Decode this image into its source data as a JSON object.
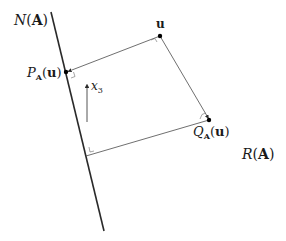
{
  "diagram": {
    "type": "orthogonal-projection",
    "colors": {
      "line": "#2a2a2a",
      "thin": "#4a4a4a",
      "point": "#000000",
      "text": "#1a1a1a"
    },
    "labels": {
      "nullspace": {
        "prefix": "N",
        "arg": "A",
        "text": "𝒩(A)"
      },
      "range": {
        "prefix": "R",
        "arg": "A",
        "text": "ℛ(A)"
      },
      "u": {
        "text": "u"
      },
      "p": {
        "base": "P",
        "sub": "A",
        "arg": "u",
        "text": "P_A(u)"
      },
      "q": {
        "base": "Q",
        "sub": "A",
        "arg": "u",
        "text": "Q_A(u)"
      },
      "x3": {
        "base": "x",
        "sub": "3",
        "text": "x_3"
      }
    },
    "points": {
      "u": [
        160,
        36
      ],
      "p": [
        66,
        72
      ],
      "q": [
        209,
        120
      ],
      "corner": [
        86,
        156
      ]
    },
    "nullspace_line": {
      "from": [
        51,
        12
      ],
      "to": [
        104,
        231
      ]
    },
    "x3_arrow": {
      "from": [
        87,
        122
      ],
      "to": [
        87,
        84
      ]
    }
  }
}
